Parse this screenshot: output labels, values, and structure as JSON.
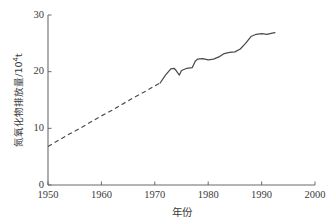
{
  "chart_data": {
    "type": "line",
    "title": "",
    "xlabel": "年份",
    "ylabel": "氮氧化物排放量/10⁴t",
    "ylabel_main": "氮氧化物排放量/10",
    "ylabel_exp": "4",
    "ylabel_unit": "t",
    "xlim": [
      1950,
      2000
    ],
    "ylim": [
      0,
      30
    ],
    "xticks": [
      "1950",
      "1960",
      "1970",
      "1980",
      "1990",
      "2000"
    ],
    "xtick_values": [
      1950,
      1960,
      1970,
      1980,
      1990,
      2000
    ],
    "yticks": [
      "0",
      "10",
      "20",
      "30"
    ],
    "ytick_values": [
      0,
      10,
      20,
      30
    ],
    "grid": false,
    "legend": false,
    "line_color": "#4a4a4a",
    "series": [
      {
        "name": "estimated",
        "style": "dashed",
        "x": [
          1950,
          1952,
          1954,
          1956,
          1958,
          1960,
          1962,
          1964,
          1966,
          1968,
          1970,
          1971
        ],
        "values": [
          6.8,
          7.9,
          9.0,
          10.0,
          11.1,
          12.2,
          13.2,
          14.3,
          15.4,
          16.4,
          17.5,
          18.0
        ]
      },
      {
        "name": "measured",
        "style": "solid",
        "x": [
          1971,
          1972,
          1973,
          1973.6,
          1974,
          1974.6,
          1975,
          1976,
          1977,
          1977.6,
          1978,
          1979,
          1980,
          1981,
          1982,
          1983,
          1984,
          1985,
          1986,
          1987,
          1988,
          1989,
          1990,
          1991,
          1992,
          1992.5
        ],
        "values": [
          18.0,
          19.4,
          20.5,
          20.6,
          20.2,
          19.4,
          20.2,
          20.6,
          20.7,
          21.9,
          22.2,
          22.3,
          22.1,
          22.2,
          22.6,
          23.2,
          23.4,
          23.5,
          24.0,
          25.0,
          26.2,
          26.6,
          26.7,
          26.6,
          26.8,
          26.9
        ]
      }
    ]
  },
  "axes": {
    "x_pixel_min": 48,
    "x_pixel_max": 315,
    "y_pixel_min": 185,
    "y_pixel_max": 15
  }
}
